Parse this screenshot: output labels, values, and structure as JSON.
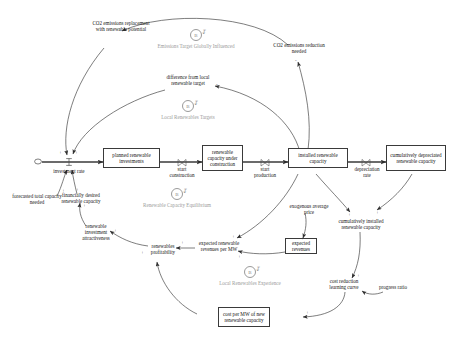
{
  "diagram": {
    "type": "causal-loop-stock-flow",
    "accent": "#3a3a3a",
    "loop_color": "#9b9b9b"
  },
  "stocks": [
    {
      "id": "planned_investments",
      "label": "planned renewable investments"
    },
    {
      "id": "capacity_under_construction",
      "label": "renewable capacity under construction"
    },
    {
      "id": "installed_capacity",
      "label": "installed renewable capacity"
    },
    {
      "id": "cumulatively_depreciated",
      "label": "cumulatively depreciated renewable capacity"
    },
    {
      "id": "expected_revenues",
      "label": "expected revenues"
    },
    {
      "id": "cost_per_mw",
      "label": "cost per MW of new renewable capacity"
    }
  ],
  "flows": [
    {
      "id": "investment_rate",
      "label": "investment rate"
    },
    {
      "id": "start_construction",
      "label": "start construction"
    },
    {
      "id": "start_production",
      "label": "start production"
    },
    {
      "id": "depreciation_rate",
      "label": "depreciation rate"
    }
  ],
  "auxiliaries": [
    {
      "id": "co2_replacement",
      "label": "CO2 emissions replacement with renewable potential"
    },
    {
      "id": "co2_reduction_needed",
      "label": "CO2 emissions reduction needed"
    },
    {
      "id": "difference_local_target",
      "label": "difference from local renewable target"
    },
    {
      "id": "forecasted_capacity",
      "label": "forecasted total capacity needed"
    },
    {
      "id": "financially_desired",
      "label": "financially desired renewable capacity"
    },
    {
      "id": "investment_attractiveness",
      "label": "renewable investment attractiveness"
    },
    {
      "id": "renewables_profitability",
      "label": "renewables profitability"
    },
    {
      "id": "expected_revenues_per_mw",
      "label": "expected renewable revenues per MW"
    },
    {
      "id": "exogenous_price",
      "label": "exogenous average price"
    },
    {
      "id": "cumulatively_installed",
      "label": "cumulatively installed renewable capacity"
    },
    {
      "id": "cost_reduction_curve",
      "label": "cost reduction learning curve"
    },
    {
      "id": "progress_ratio",
      "label": "progress ratio"
    }
  ],
  "loops": [
    {
      "id": "emissions_target",
      "marker": "B",
      "name": "Emissions Target Globally Influenced"
    },
    {
      "id": "local_targets",
      "marker": "B",
      "name": "Local Renewables Targets"
    },
    {
      "id": "capacity_equilibrium",
      "marker": "B",
      "name": "Renewable Capacity Equilibrium"
    },
    {
      "id": "local_experience",
      "marker": "B",
      "name": "Local Renewables Experience"
    }
  ],
  "polarities": {
    "plus": "+",
    "minus": "-"
  }
}
